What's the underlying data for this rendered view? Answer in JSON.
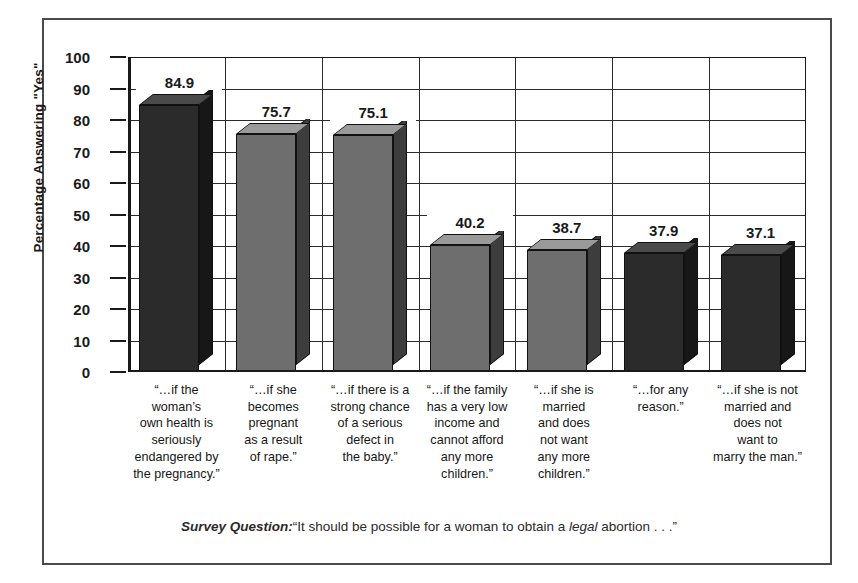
{
  "chart_data": {
    "type": "bar",
    "title": "",
    "xlabel": "",
    "ylabel": "Percentage Answering \"Yes\"",
    "ylim": [
      0,
      100
    ],
    "ytick_step": 10,
    "yticks": [
      "100",
      "90",
      "80",
      "70",
      "60",
      "50",
      "40",
      "30",
      "20",
      "10",
      "0"
    ],
    "grid": "both",
    "legend": "none",
    "style": "3d-bars",
    "categories": [
      "“…if the woman’s own health is seriously endangered by the pregnancy.”",
      "“…if she becomes pregnant as a result of rape.”",
      "“…if there is a strong chance of a serious defect in the baby.”",
      "“…if the family has a very low income and cannot afford any more children.”",
      "“…if she is married and does not want any more children.”",
      "“…for any reason.”",
      "“…if she is not married and does not want to marry the man.”"
    ],
    "category_lines": [
      [
        "“…if the",
        "woman’s",
        "own health is",
        "seriously",
        "endangered by",
        "the pregnancy.”"
      ],
      [
        "“…if she",
        "becomes",
        "pregnant",
        "as a result",
        "of rape.”"
      ],
      [
        "“…if there is a",
        "strong chance",
        "of a serious",
        "defect in",
        "the baby.”"
      ],
      [
        "“…if the family",
        "has a very low",
        "income and",
        "cannot afford",
        "any more",
        "children.”"
      ],
      [
        "“…if she is",
        "married",
        "and does",
        "not want",
        "any more",
        "children.”"
      ],
      [
        "“…for any",
        "reason.”"
      ],
      [
        "“…if she is not",
        "married and",
        "does not",
        "want to",
        "marry the man.”"
      ]
    ],
    "values": [
      84.9,
      75.7,
      75.1,
      40.2,
      38.7,
      37.9,
      37.1
    ],
    "value_labels": [
      "84.9",
      "75.7",
      "75.1",
      "40.2",
      "38.7",
      "37.9",
      "37.1"
    ],
    "bar_shades": [
      "dark",
      "light",
      "light",
      "light",
      "light",
      "dark",
      "dark"
    ],
    "colors": {
      "bar_dark_front": "#2b2b2b",
      "bar_dark_top": "#4a4a4a",
      "bar_dark_side": "#171717",
      "bar_light_front": "#6e6e6e",
      "bar_light_top": "#9a9a9a",
      "bar_light_side": "#3d3d3d",
      "axis": "#1a1a1a",
      "grid": "#2b2b2b",
      "frame": "#4a4a4a",
      "text": "#1a1a1a",
      "background": "#ffffff"
    }
  },
  "caption": {
    "label": "Survey Question:",
    "text_before": "“It should be possible for a woman to obtain a ",
    "emphasis": "legal",
    "text_after": " abortion . . .”"
  }
}
